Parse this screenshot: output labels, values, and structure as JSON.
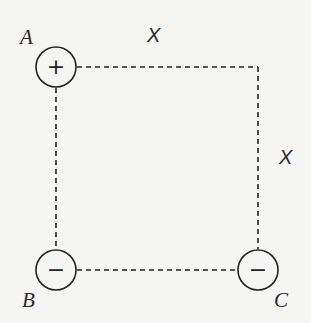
{
  "diagram": {
    "side_label_top": "X",
    "side_label_right": "X",
    "charges": [
      {
        "id": "A",
        "label": "A",
        "sign": "+",
        "x": 56,
        "y": 67
      },
      {
        "id": "B",
        "label": "B",
        "sign": "−",
        "x": 56,
        "y": 270
      },
      {
        "id": "C",
        "label": "C",
        "sign": "−",
        "x": 258,
        "y": 270
      }
    ],
    "empty_corner": {
      "x": 258,
      "y": 67
    },
    "colors": {
      "ink": "#222222",
      "background": "#f5f5f3"
    }
  }
}
